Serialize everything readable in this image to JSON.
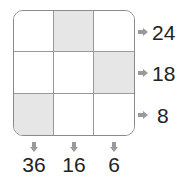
{
  "puzzle": {
    "rows": 3,
    "cols": 3,
    "shaded_cells": [
      [
        0,
        1
      ],
      [
        1,
        2
      ],
      [
        2,
        0
      ]
    ],
    "row_clues": [
      "24",
      "18",
      "8"
    ],
    "col_clues": [
      "36",
      "16",
      "6"
    ],
    "colors": {
      "shade": "#e6e6e6",
      "border": "#8a8a8a",
      "arrow": "#9a9a9a",
      "text": "#222222"
    }
  }
}
